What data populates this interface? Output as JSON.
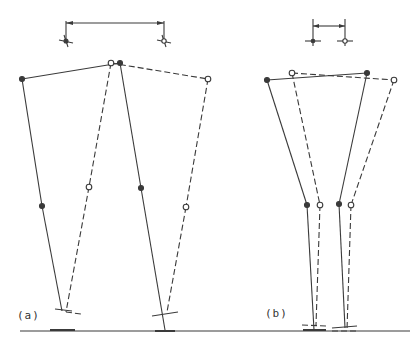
{
  "figure": {
    "panel_a": {
      "label": "(a)"
    },
    "panel_b": {
      "label": "(b)"
    }
  },
  "colors": {
    "ink": "#3a3a3a",
    "background": "#ffffff"
  },
  "legend_semantics": {
    "solid_line": "position 1 (filled joints)",
    "dashed_line": "position 2 (open joints)"
  }
}
